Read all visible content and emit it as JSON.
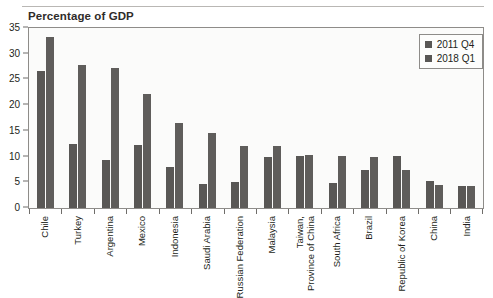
{
  "chart_data": {
    "type": "bar",
    "title": "Percentage of GDP",
    "xlabel": "",
    "ylabel": "",
    "ylim": [
      0,
      35
    ],
    "yticks": [
      0,
      5,
      10,
      15,
      20,
      25,
      30,
      35
    ],
    "grid": false,
    "legend_position": "top-right",
    "bar_color": "#595755",
    "categories": [
      "Chile",
      "Turkey",
      "Argentina",
      "Mexico",
      "Indonesia",
      "Saudi Arabia",
      "Russian Federation",
      "Malaysia",
      "Taiwan, Province of China",
      "South Africa",
      "Brazil",
      "Republic of Korea",
      "China",
      "India"
    ],
    "series": [
      {
        "name": "2011 Q4",
        "values": [
          26.7,
          12.4,
          9.3,
          12.3,
          7.9,
          4.6,
          5.0,
          10.0,
          10.1,
          4.8,
          7.3,
          10.1,
          5.3,
          4.3
        ]
      },
      {
        "name": "2018 Q1",
        "values": [
          33.2,
          27.8,
          27.3,
          22.1,
          16.5,
          14.6,
          12.0,
          12.0,
          10.3,
          10.2,
          9.9,
          7.4,
          4.5,
          4.3
        ]
      }
    ]
  }
}
